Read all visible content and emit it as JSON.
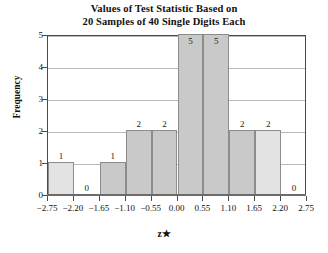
{
  "chart_data": {
    "type": "bar",
    "title": "Values of Test Statistic Based on 20 Samples of 40 Single Digits Each",
    "title_lines": [
      "Values of Test Statistic Based on",
      "20 Samples of 40 Single Digits Each"
    ],
    "xlabel": "z★",
    "ylabel": "Frequency",
    "categories": [
      "-2.75 to -2.20",
      "-2.20 to -1.65",
      "-1.65 to -1.10",
      "-1.10 to -0.55",
      "-0.55 to 0.00",
      "0.00 to 0.55",
      "0.55 to 1.10",
      "1.10 to 1.65",
      "1.65 to 2.20",
      "2.20 to 2.75"
    ],
    "values": [
      1,
      0,
      1,
      2,
      2,
      5,
      5,
      2,
      2,
      0
    ],
    "bin_edges": [
      -2.75,
      -2.2,
      -1.65,
      -1.1,
      -0.55,
      0.0,
      0.55,
      1.1,
      1.65,
      2.2,
      2.75
    ],
    "bar_colors": [
      "#e3e3e3",
      "none",
      "#c9c9c9",
      "#c9c9c9",
      "#c9c9c9",
      "#c9c9c9",
      "#c9c9c9",
      "#c9c9c9",
      "#e3e3e3",
      "none"
    ],
    "bar_labels": [
      "1",
      "0",
      "1",
      "2",
      "2",
      "5",
      "5",
      "2",
      "2",
      "0"
    ],
    "label_inside": [
      false,
      false,
      false,
      false,
      false,
      true,
      true,
      false,
      false,
      false
    ],
    "xticks": [
      "-2.75",
      "-2.20",
      "-1.65",
      "-1.10",
      "-0.55",
      "0.00",
      "0.55",
      "1.10",
      "1.65",
      "2.20",
      "2.75"
    ],
    "xtick_values": [
      -2.75,
      -2.2,
      -1.65,
      -1.1,
      -0.55,
      0.0,
      0.55,
      1.1,
      1.65,
      2.2,
      2.75
    ],
    "yticks": [
      "0",
      "1",
      "2",
      "3",
      "4",
      "5"
    ],
    "ytick_values": [
      0,
      1,
      2,
      3,
      4,
      5
    ],
    "ylim": [
      0,
      5
    ],
    "xlim": [
      -2.75,
      2.75
    ],
    "grid": "horizontal",
    "legend": "none",
    "total_count": 20,
    "bar_edge_color": "#8c8c8c",
    "grid_color": "#b9b9b9",
    "frame_color": "#4a4a4a",
    "background": "#ffffff"
  }
}
